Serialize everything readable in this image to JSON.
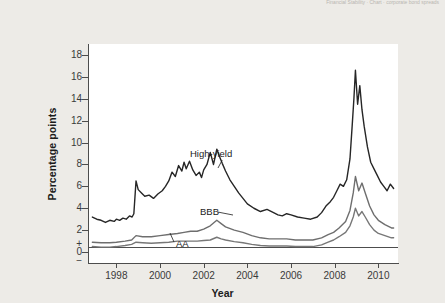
{
  "page": {
    "header_remnant": "Financial Stability ·  Chart  ·  corporate bond spreads"
  },
  "chart_data": {
    "type": "line",
    "title": "",
    "xlabel": "Year",
    "ylabel": "Percentage points",
    "xlim": [
      1996.7,
      2010.9
    ],
    "ylim": [
      -1,
      19
    ],
    "grid": false,
    "legend": "inline-annotations",
    "y_ticks": [
      "18",
      "16",
      "14",
      "12",
      "10",
      "8",
      "6",
      "4",
      "2",
      "+",
      "0",
      "−"
    ],
    "y_tick_values": [
      18,
      16,
      14,
      12,
      10,
      8,
      6,
      4,
      2,
      0
    ],
    "x_ticks": [
      "1998",
      "2000",
      "2002",
      "2004",
      "2006",
      "2008",
      "2010"
    ],
    "x_tick_values": [
      1998,
      2000,
      2002,
      2004,
      2006,
      2008,
      2010
    ],
    "zero_line": 0,
    "annotations": [
      {
        "label": "High-yield",
        "x": 2001.1,
        "y": 8.0
      },
      {
        "label": "BBB",
        "x": 2001.9,
        "y": 3.4
      },
      {
        "label": "AA",
        "x": 2001.6,
        "y": 0.55
      }
    ],
    "series": [
      {
        "name": "High-yield",
        "color": "#262626",
        "width": 1.4,
        "x": [
          1996.9,
          1997.1,
          1997.3,
          1997.5,
          1997.7,
          1997.9,
          1998.0,
          1998.15,
          1998.3,
          1998.45,
          1998.6,
          1998.72,
          1998.8,
          1998.9,
          1999.0,
          1999.15,
          1999.3,
          1999.5,
          1999.7,
          1999.9,
          2000.1,
          2000.25,
          2000.4,
          2000.55,
          2000.7,
          2000.85,
          2001.0,
          2001.1,
          2001.2,
          2001.35,
          2001.5,
          2001.65,
          2001.8,
          2001.9,
          2002.0,
          2002.15,
          2002.3,
          2002.45,
          2002.6,
          2002.75,
          2002.85,
          2003.0,
          2003.2,
          2003.4,
          2003.6,
          2003.8,
          2004.0,
          2004.3,
          2004.6,
          2004.9,
          2005.2,
          2005.4,
          2005.6,
          2005.8,
          2006.0,
          2006.3,
          2006.6,
          2006.9,
          2007.2,
          2007.4,
          2007.6,
          2007.8,
          2007.95,
          2008.1,
          2008.25,
          2008.4,
          2008.55,
          2008.7,
          2008.8,
          2008.88,
          2008.95,
          2009.05,
          2009.15,
          2009.25,
          2009.35,
          2009.5,
          2009.65,
          2009.8,
          2009.95,
          2010.1,
          2010.25,
          2010.4,
          2010.55,
          2010.7
        ],
        "y": [
          3.2,
          3.0,
          2.9,
          2.7,
          2.9,
          2.8,
          3.0,
          2.9,
          3.1,
          3.0,
          3.3,
          3.2,
          3.5,
          6.5,
          5.7,
          5.4,
          5.1,
          5.2,
          4.9,
          5.3,
          5.6,
          6.0,
          6.5,
          7.3,
          6.9,
          7.9,
          7.4,
          8.2,
          7.6,
          8.3,
          7.5,
          7.0,
          7.3,
          6.8,
          7.5,
          8.0,
          9.1,
          8.0,
          9.4,
          8.6,
          8.1,
          7.4,
          6.6,
          6.0,
          5.4,
          4.9,
          4.4,
          4.0,
          3.7,
          3.9,
          3.6,
          3.4,
          3.3,
          3.5,
          3.4,
          3.2,
          3.1,
          3.0,
          3.2,
          3.6,
          4.2,
          4.6,
          5.0,
          5.6,
          6.2,
          6.0,
          6.6,
          8.5,
          11.5,
          14.0,
          16.6,
          13.5,
          15.2,
          13.0,
          11.5,
          9.6,
          8.2,
          7.6,
          7.0,
          6.4,
          6.0,
          5.6,
          6.2,
          5.8
        ]
      },
      {
        "name": "BBB",
        "color": "#6e6e6e",
        "width": 1.4,
        "x": [
          1996.9,
          1997.3,
          1997.7,
          1998.0,
          1998.4,
          1998.7,
          1998.9,
          1999.2,
          1999.6,
          2000.0,
          2000.4,
          2000.8,
          2001.1,
          2001.4,
          2001.7,
          2002.0,
          2002.3,
          2002.6,
          2002.8,
          2003.0,
          2003.4,
          2003.8,
          2004.2,
          2004.6,
          2005.0,
          2005.4,
          2005.8,
          2006.2,
          2006.6,
          2007.0,
          2007.4,
          2007.7,
          2007.95,
          2008.2,
          2008.5,
          2008.7,
          2008.85,
          2008.95,
          2009.1,
          2009.25,
          2009.4,
          2009.6,
          2009.8,
          2010.0,
          2010.3,
          2010.6,
          2010.7
        ],
        "y": [
          0.9,
          0.85,
          0.85,
          0.9,
          1.0,
          1.1,
          1.5,
          1.4,
          1.4,
          1.5,
          1.6,
          1.7,
          1.8,
          1.9,
          1.9,
          2.1,
          2.4,
          2.9,
          2.6,
          2.3,
          2.0,
          1.8,
          1.5,
          1.3,
          1.2,
          1.2,
          1.2,
          1.1,
          1.1,
          1.1,
          1.3,
          1.6,
          1.8,
          2.2,
          2.8,
          3.8,
          5.4,
          6.9,
          5.6,
          6.3,
          5.4,
          4.2,
          3.4,
          2.9,
          2.5,
          2.2,
          2.2
        ]
      },
      {
        "name": "AA",
        "color": "#777777",
        "width": 1.4,
        "x": [
          1996.9,
          1997.3,
          1997.7,
          1998.0,
          1998.4,
          1998.7,
          1998.9,
          1999.2,
          1999.6,
          2000.0,
          2000.4,
          2000.8,
          2001.1,
          2001.4,
          2001.7,
          2002.0,
          2002.3,
          2002.6,
          2002.8,
          2003.0,
          2003.4,
          2003.8,
          2004.2,
          2004.6,
          2005.0,
          2005.4,
          2005.8,
          2006.2,
          2006.6,
          2007.0,
          2007.4,
          2007.7,
          2007.95,
          2008.2,
          2008.5,
          2008.7,
          2008.85,
          2008.95,
          2009.1,
          2009.25,
          2009.4,
          2009.6,
          2009.8,
          2010.0,
          2010.3,
          2010.6,
          2010.7
        ],
        "y": [
          0.5,
          0.45,
          0.45,
          0.5,
          0.6,
          0.7,
          0.9,
          0.85,
          0.8,
          0.85,
          0.9,
          1.0,
          1.0,
          1.0,
          1.0,
          1.05,
          1.1,
          1.35,
          1.2,
          1.1,
          0.95,
          0.85,
          0.7,
          0.6,
          0.55,
          0.55,
          0.55,
          0.5,
          0.5,
          0.5,
          0.65,
          0.9,
          1.1,
          1.4,
          1.8,
          2.4,
          3.2,
          4.0,
          3.3,
          3.7,
          3.2,
          2.5,
          2.0,
          1.7,
          1.5,
          1.3,
          1.3
        ]
      }
    ]
  }
}
